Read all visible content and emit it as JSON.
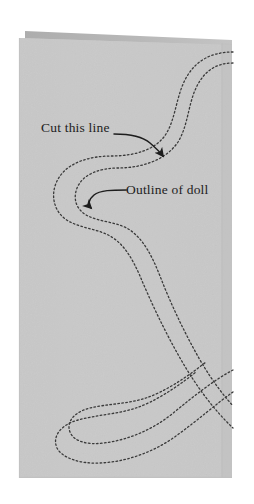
{
  "figure": {
    "paper": {
      "fill_color": "#c9c9c9",
      "fold_strip_color": "#b4b4b4",
      "edge_line_color": "#bdbdbd",
      "left": 19,
      "top": 31,
      "right": 232,
      "bottom": 478,
      "fold_edge_x": 222
    },
    "cut_lines": {
      "color": "#3a3a3a",
      "style": "dotted",
      "dash_pattern": "1.6 2.4",
      "stroke_width": 1.3,
      "description": "Two parallel dotted S-curves running across the folded paper"
    },
    "arrows": {
      "color": "#1d1d1d",
      "stroke_width": 1.5
    }
  },
  "annotations": [
    {
      "id": "cut-this-line",
      "text": "Cut this line",
      "points_to": "outer dotted line",
      "arrow": "curves right and down to the outer cut line"
    },
    {
      "id": "outline-of-doll",
      "text": "Outline of doll",
      "points_to": "inner dotted line",
      "arrow": "curves left and down to the inner doll outline"
    }
  ]
}
